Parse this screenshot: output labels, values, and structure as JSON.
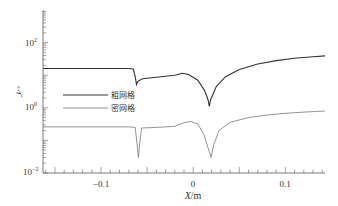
{
  "chart_data": {
    "type": "line",
    "title": "",
    "xlabel": "X/m",
    "ylabel": "y+",
    "xlim": [
      -0.163,
      0.143
    ],
    "ylim": [
      0.01,
      1000
    ],
    "yscale": "log",
    "grid": false,
    "legend_position": "upper-left-inside",
    "x_ticks": [
      -0.1,
      0,
      0.1
    ],
    "x_tick_labels": [
      "-0.1",
      "0",
      "0.1"
    ],
    "y_ticks": [
      0.01,
      1,
      100
    ],
    "y_tick_labels": [
      "10^-2",
      "10^0",
      "10^2"
    ],
    "series": [
      {
        "name": "粗网格",
        "color": "#333333",
        "points": [
          [
            -0.163,
            16
          ],
          [
            -0.12,
            16
          ],
          [
            -0.07,
            16
          ],
          [
            -0.065,
            15.5
          ],
          [
            -0.063,
            9
          ],
          [
            -0.0615,
            5.2
          ],
          [
            -0.06,
            6.5
          ],
          [
            -0.055,
            7.8
          ],
          [
            -0.04,
            8.6
          ],
          [
            -0.02,
            10
          ],
          [
            -0.012,
            11.5
          ],
          [
            -0.005,
            10.5
          ],
          [
            0.005,
            7
          ],
          [
            0.012,
            3.5
          ],
          [
            0.016,
            1.8
          ],
          [
            0.0175,
            1.1
          ],
          [
            0.019,
            1.8
          ],
          [
            0.025,
            4.5
          ],
          [
            0.035,
            9
          ],
          [
            0.05,
            15
          ],
          [
            0.07,
            22
          ],
          [
            0.09,
            28
          ],
          [
            0.11,
            33
          ],
          [
            0.13,
            37
          ],
          [
            0.143,
            39
          ]
        ]
      },
      {
        "name": "密网格",
        "color": "#666666",
        "points": [
          [
            -0.163,
            0.26
          ],
          [
            -0.12,
            0.26
          ],
          [
            -0.07,
            0.26
          ],
          [
            -0.063,
            0.25
          ],
          [
            -0.061,
            0.08
          ],
          [
            -0.0595,
            0.03
          ],
          [
            -0.058,
            0.09
          ],
          [
            -0.056,
            0.24
          ],
          [
            -0.04,
            0.25
          ],
          [
            -0.02,
            0.27
          ],
          [
            -0.01,
            0.35
          ],
          [
            -0.003,
            0.38
          ],
          [
            0.005,
            0.32
          ],
          [
            0.012,
            0.14
          ],
          [
            0.016,
            0.06
          ],
          [
            0.0195,
            0.03
          ],
          [
            0.022,
            0.07
          ],
          [
            0.028,
            0.2
          ],
          [
            0.04,
            0.36
          ],
          [
            0.06,
            0.5
          ],
          [
            0.08,
            0.6
          ],
          [
            0.1,
            0.68
          ],
          [
            0.12,
            0.74
          ],
          [
            0.143,
            0.8
          ]
        ]
      }
    ]
  },
  "labels": {
    "legend_coarse": "粗网格",
    "legend_fine": "密网格",
    "x_axis_label_var": "X",
    "x_axis_label_unit": "/m",
    "y_axis_label": "y",
    "y_axis_label_sup": "+",
    "xtick_neg": "−0.1",
    "xtick_zero": "0",
    "xtick_pos": "0.1",
    "ytick_base": "10",
    "ytick_2_exp": "2",
    "ytick_0_exp": "0",
    "ytick_m2_exp": "−2"
  }
}
